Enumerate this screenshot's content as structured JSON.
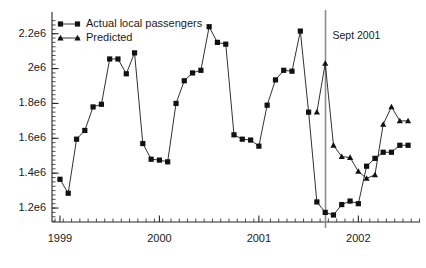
{
  "chart_data": {
    "type": "line",
    "title": "",
    "subtitle": "",
    "xlabel": "",
    "ylabel": "",
    "grid": false,
    "legend_position": "top-left",
    "xlim": [
      1998.92,
      2002.62
    ],
    "ylim": [
      1120000,
      2290000
    ],
    "x_tick_labels": [
      "1999",
      "2000",
      "2001",
      "2002"
    ],
    "x_tick_values": [
      1999,
      2000,
      2001,
      2002
    ],
    "x_minor_tick_step": 0.0833,
    "y_tick_labels": [
      "1.2e6",
      "1.4e6",
      "1.6e6",
      "1.8e6",
      "2e6",
      "2.2e6"
    ],
    "y_tick_values": [
      1200000,
      1400000,
      1600000,
      1800000,
      2000000,
      2200000
    ],
    "y_minor_tick_step": 25000,
    "annotations": [
      {
        "name": "sept-2001-event-line",
        "label": "Sept 2001",
        "x": 2001.67,
        "type": "vline-with-label"
      }
    ],
    "series": [
      {
        "name": "Actual local passengers",
        "marker": "square",
        "color": "#111111",
        "x": [
          1999.0,
          1999.083,
          1999.167,
          1999.25,
          1999.333,
          1999.417,
          1999.5,
          1999.583,
          1999.667,
          1999.75,
          1999.833,
          1999.917,
          2000.0,
          2000.083,
          2000.167,
          2000.25,
          2000.333,
          2000.417,
          2000.5,
          2000.583,
          2000.667,
          2000.75,
          2000.833,
          2000.917,
          2001.0,
          2001.083,
          2001.167,
          2001.25,
          2001.333,
          2001.417,
          2001.5,
          2001.583,
          2001.667,
          2001.75,
          2001.833,
          2001.917,
          2002.0,
          2002.083,
          2002.167,
          2002.25,
          2002.333,
          2002.417,
          2002.5
        ],
        "y": [
          1365000,
          1285000,
          1595000,
          1645000,
          1780000,
          1795000,
          2055000,
          2055000,
          1970000,
          2090000,
          1570000,
          1480000,
          1475000,
          1465000,
          1800000,
          1930000,
          1975000,
          1990000,
          2240000,
          2150000,
          2140000,
          1620000,
          1595000,
          1590000,
          1555000,
          1790000,
          1935000,
          1990000,
          1985000,
          2215000,
          1750000,
          1235000,
          1175000,
          1160000,
          1220000,
          1240000,
          1225000,
          1440000,
          1485000,
          1520000,
          1520000,
          1560000,
          1560000
        ]
      },
      {
        "name": "Predicted",
        "marker": "triangle",
        "color": "#111111",
        "x": [
          2001.583,
          2001.667,
          2001.75,
          2001.833,
          2001.917,
          2002.0,
          2002.083,
          2002.167,
          2002.25,
          2002.333,
          2002.417,
          2002.5
        ],
        "y": [
          1750000,
          2030000,
          1560000,
          1495000,
          1490000,
          1410000,
          1370000,
          1390000,
          1680000,
          1780000,
          1700000,
          1700000
        ]
      }
    ]
  },
  "legend": {
    "entries": [
      {
        "label": "Actual local passengers",
        "marker": "square"
      },
      {
        "label": "Predicted",
        "marker": "triangle"
      }
    ]
  }
}
